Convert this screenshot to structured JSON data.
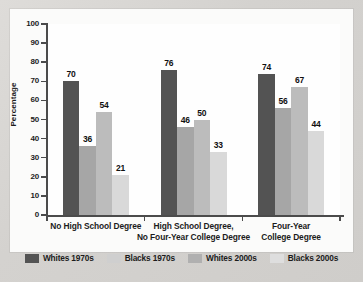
{
  "chart_data": {
    "type": "bar",
    "title": "",
    "xlabel": "",
    "ylabel": "Percentage",
    "ylim": [
      0,
      100
    ],
    "ytick_step": 10,
    "yticks": [
      100,
      90,
      80,
      70,
      60,
      50,
      40,
      30,
      20,
      10,
      0
    ],
    "grid": false,
    "legend_position": "bottom",
    "categories": [
      "No High School Degree",
      "High School Degree,\nNo Four-Year College Degree",
      "Four-Year\nCollege Degree"
    ],
    "category_lines": [
      [
        "No High School Degree"
      ],
      [
        "High School Degree,",
        "No Four-Year College Degree"
      ],
      [
        "Four-Year",
        "College Degree"
      ]
    ],
    "series": [
      {
        "name": "Whites 1970s",
        "color": "#535353",
        "values": [
          70,
          76,
          74
        ]
      },
      {
        "name": "Blacks 1970s",
        "color": "#a6a6a6",
        "values": [
          36,
          46,
          56
        ]
      },
      {
        "name": "Whites 2000s",
        "color": "#bcbcbc",
        "values": [
          54,
          50,
          67
        ]
      },
      {
        "name": "Blacks 2000s",
        "color": "#d9d9d9",
        "values": [
          21,
          33,
          44
        ]
      }
    ]
  },
  "legend": [
    {
      "label": "Whites 1970s",
      "color": "#535353"
    },
    {
      "label": "Blacks 1970s",
      "color": "#cfcfcf"
    },
    {
      "label": "Whites 2000s",
      "color": "#b0b0b0"
    },
    {
      "label": "Blacks 2000s",
      "color": "#dedede"
    }
  ],
  "axis": {
    "y_label": "Percentage",
    "y_ticks": [
      "100",
      "90",
      "80",
      "70",
      "60",
      "50",
      "40",
      "30",
      "20",
      "10",
      "0"
    ]
  }
}
